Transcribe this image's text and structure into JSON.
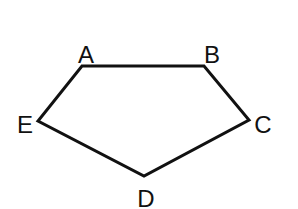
{
  "diagram": {
    "type": "pentagon",
    "stroke_color": "#111111",
    "background": "#ffffff",
    "vertices": [
      {
        "name": "A",
        "x": 82,
        "y": 66,
        "label_x": 86,
        "label_y": 63
      },
      {
        "name": "B",
        "x": 204,
        "y": 66,
        "label_x": 212,
        "label_y": 63
      },
      {
        "name": "C",
        "x": 249,
        "y": 120,
        "label_x": 263,
        "label_y": 133
      },
      {
        "name": "D",
        "x": 144,
        "y": 176,
        "label_x": 146,
        "label_y": 207
      },
      {
        "name": "E",
        "x": 38,
        "y": 121,
        "label_x": 25,
        "label_y": 133
      }
    ],
    "edges": [
      [
        "A",
        "B"
      ],
      [
        "B",
        "C"
      ],
      [
        "C",
        "D"
      ],
      [
        "D",
        "E"
      ],
      [
        "E",
        "A"
      ]
    ]
  }
}
